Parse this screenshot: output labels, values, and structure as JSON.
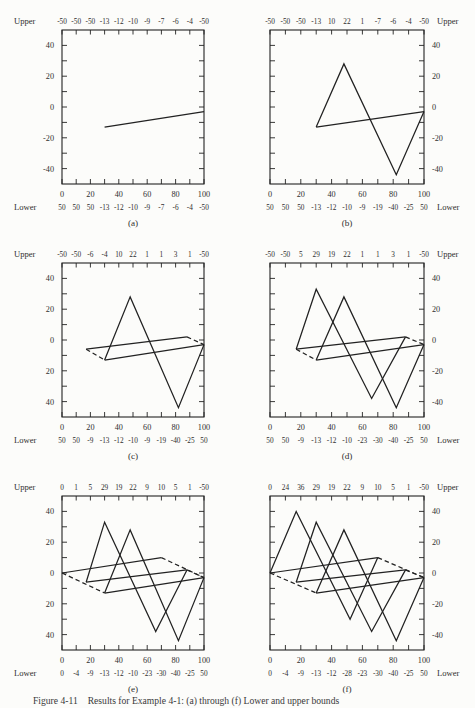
{
  "page": {
    "background": "#fcfcfa",
    "ink": "#2e2e2e",
    "line_color": "#222222"
  },
  "caption": {
    "number": "Figure 4-11",
    "text": "Results for Example 4-1: (a) through (f) Lower and upper bounds"
  },
  "chart_data": [
    {
      "type": "line",
      "label": "(a)",
      "label_side": "left",
      "upper_word": "Upper",
      "lower_word": "Lower",
      "upper_row": [
        "-50",
        "-50",
        "-50",
        "-13",
        "-12",
        "-10",
        "-9",
        "-7",
        "-6",
        "-4",
        "-50"
      ],
      "lower_row": [
        "50",
        "50",
        "50",
        "-13",
        "-12",
        "-10",
        "-9",
        "-7",
        "-6",
        "-4",
        "-50"
      ],
      "x_tick_labels": [
        "0",
        "20",
        "40",
        "60",
        "80",
        "100"
      ],
      "y_tick_labels": [
        "40",
        "20",
        "0",
        "-20",
        "-40"
      ],
      "xlim": [
        0,
        100
      ],
      "ylim": [
        -50,
        50
      ],
      "series": [
        {
          "name": "segment-1",
          "style": "solid",
          "points": [
            [
              30,
              -13
            ],
            [
              100,
              -3
            ]
          ]
        }
      ]
    },
    {
      "type": "line",
      "label": "(b)",
      "label_side": "right",
      "upper_word": "Upper",
      "lower_word": "Lower",
      "upper_row": [
        "-50",
        "-50",
        "-50",
        "-13",
        "10",
        "22",
        "1",
        "-7",
        "-6",
        "-4",
        "-50"
      ],
      "lower_row": [
        "50",
        "50",
        "50",
        "-13",
        "-12",
        "-10",
        "-9",
        "-19",
        "-40",
        "-25",
        "50"
      ],
      "x_tick_labels": [
        "0",
        "20",
        "40",
        "60",
        "80",
        "100"
      ],
      "y_tick_labels": [
        "40",
        "20",
        "0",
        "-20",
        "-40"
      ],
      "xlim": [
        0,
        100
      ],
      "ylim": [
        -50,
        50
      ],
      "series": [
        {
          "name": "segment-1",
          "style": "solid",
          "points": [
            [
              30,
              -13
            ],
            [
              100,
              -3
            ]
          ]
        },
        {
          "name": "zigzag-1",
          "style": "solid",
          "points": [
            [
              30,
              -13
            ],
            [
              48,
              28
            ],
            [
              82,
              -44
            ],
            [
              100,
              -3
            ]
          ]
        }
      ]
    },
    {
      "type": "line",
      "label": "(c)",
      "label_side": "left",
      "upper_word": "Upper",
      "lower_word": "Lower",
      "upper_row": [
        "-50",
        "-50",
        "-6",
        "-4",
        "10",
        "22",
        "1",
        "1",
        "3",
        "1",
        "-50"
      ],
      "lower_row": [
        "50",
        "50",
        "-9",
        "-13",
        "-12",
        "-10",
        "-9",
        "-19",
        "-40",
        "-25",
        "50"
      ],
      "x_tick_labels": [
        "0",
        "20",
        "40",
        "60",
        "80",
        "100"
      ],
      "y_tick_labels": [
        "40",
        "20",
        "0",
        "20",
        "40"
      ],
      "xlim": [
        0,
        100
      ],
      "ylim": [
        -50,
        50
      ],
      "series": [
        {
          "name": "segment-1",
          "style": "solid",
          "points": [
            [
              30,
              -13
            ],
            [
              100,
              -3
            ]
          ]
        },
        {
          "name": "zigzag-1",
          "style": "solid",
          "points": [
            [
              30,
              -13
            ],
            [
              48,
              28
            ],
            [
              82,
              -44
            ],
            [
              100,
              -3
            ]
          ]
        },
        {
          "name": "upper-bound-2",
          "style": "solid",
          "points": [
            [
              17,
              -6
            ],
            [
              88,
              2
            ]
          ]
        },
        {
          "name": "upper-bound-2-dash-left",
          "style": "dashed",
          "points": [
            [
              17,
              -6
            ],
            [
              30,
              -13
            ]
          ]
        },
        {
          "name": "upper-bound-2-dash-right",
          "style": "dashed",
          "points": [
            [
              88,
              2
            ],
            [
              100,
              -3
            ]
          ]
        }
      ]
    },
    {
      "type": "line",
      "label": "(d)",
      "label_side": "right",
      "upper_word": "Upper",
      "lower_word": "Lower",
      "upper_row": [
        "-50",
        "-50",
        "5",
        "29",
        "19",
        "22",
        "1",
        "1",
        "3",
        "1",
        "-50"
      ],
      "lower_row": [
        "50",
        "50",
        "-9",
        "-13",
        "-12",
        "-10",
        "-23",
        "-30",
        "-40",
        "-25",
        "50"
      ],
      "x_tick_labels": [
        "0",
        "20",
        "40",
        "60",
        "80",
        "100"
      ],
      "y_tick_labels": [
        "40",
        "20",
        "0",
        "-20",
        "-40"
      ],
      "xlim": [
        0,
        100
      ],
      "ylim": [
        -50,
        50
      ],
      "series": [
        {
          "name": "segment-1",
          "style": "solid",
          "points": [
            [
              30,
              -13
            ],
            [
              100,
              -3
            ]
          ]
        },
        {
          "name": "zigzag-1",
          "style": "solid",
          "points": [
            [
              30,
              -13
            ],
            [
              48,
              28
            ],
            [
              82,
              -44
            ],
            [
              100,
              -3
            ]
          ]
        },
        {
          "name": "zigzag-2",
          "style": "solid",
          "points": [
            [
              17,
              -6
            ],
            [
              30,
              33
            ],
            [
              66,
              -38
            ],
            [
              88,
              2
            ]
          ]
        },
        {
          "name": "upper-bound-2",
          "style": "solid",
          "points": [
            [
              17,
              -6
            ],
            [
              88,
              2
            ]
          ]
        },
        {
          "name": "upper-bound-2-dash-left",
          "style": "dashed",
          "points": [
            [
              17,
              -6
            ],
            [
              30,
              -13
            ]
          ]
        },
        {
          "name": "upper-bound-2-dash-right",
          "style": "dashed",
          "points": [
            [
              88,
              2
            ],
            [
              100,
              -3
            ]
          ]
        }
      ]
    },
    {
      "type": "line",
      "label": "(e)",
      "label_side": "left",
      "upper_word": "Upper",
      "lower_word": "Lower",
      "upper_row": [
        "0",
        "1",
        "5",
        "29",
        "19",
        "22",
        "9",
        "10",
        "5",
        "1",
        "-50"
      ],
      "lower_row": [
        "0",
        "-4",
        "-9",
        "-13",
        "-12",
        "-10",
        "-23",
        "-30",
        "-40",
        "-25",
        "50"
      ],
      "x_tick_labels": [
        "0",
        "20",
        "40",
        "60",
        "80",
        "100"
      ],
      "y_tick_labels": [
        "40",
        "20",
        "0",
        "20",
        "40"
      ],
      "xlim": [
        0,
        100
      ],
      "ylim": [
        -50,
        50
      ],
      "series": [
        {
          "name": "segment-1",
          "style": "solid",
          "points": [
            [
              30,
              -13
            ],
            [
              100,
              -3
            ]
          ]
        },
        {
          "name": "zigzag-1",
          "style": "solid",
          "points": [
            [
              30,
              -13
            ],
            [
              48,
              28
            ],
            [
              82,
              -44
            ],
            [
              100,
              -3
            ]
          ]
        },
        {
          "name": "zigzag-2",
          "style": "solid",
          "points": [
            [
              17,
              -6
            ],
            [
              30,
              33
            ],
            [
              66,
              -38
            ],
            [
              88,
              2
            ]
          ]
        },
        {
          "name": "upper-bound-2",
          "style": "solid",
          "points": [
            [
              17,
              -6
            ],
            [
              88,
              2
            ]
          ]
        },
        {
          "name": "upper-bound-3",
          "style": "solid",
          "points": [
            [
              0,
              0
            ],
            [
              70,
              10
            ]
          ]
        },
        {
          "name": "lower-bound-dash-left",
          "style": "dashed",
          "points": [
            [
              0,
              0
            ],
            [
              30,
              -13
            ]
          ]
        },
        {
          "name": "upper-bound-2-dash-right",
          "style": "dashed",
          "points": [
            [
              88,
              2
            ],
            [
              100,
              -3
            ]
          ]
        },
        {
          "name": "upper-bound-3-dash-right",
          "style": "dashed",
          "points": [
            [
              70,
              10
            ],
            [
              100,
              -3
            ]
          ]
        }
      ]
    },
    {
      "type": "line",
      "label": "(f)",
      "label_side": "right",
      "upper_word": "Upper",
      "lower_word": "Lower",
      "upper_row": [
        "0",
        "24",
        "36",
        "29",
        "19",
        "22",
        "9",
        "10",
        "5",
        "1",
        "-50"
      ],
      "lower_row": [
        "0",
        "-4",
        "-9",
        "-13",
        "-12",
        "-28",
        "-23",
        "-30",
        "-40",
        "-25",
        "50"
      ],
      "x_tick_labels": [
        "0",
        "20",
        "40",
        "60",
        "80",
        "100"
      ],
      "y_tick_labels": [
        "40",
        "20",
        "0",
        "-20",
        "-40"
      ],
      "xlim": [
        0,
        100
      ],
      "ylim": [
        -50,
        50
      ],
      "series": [
        {
          "name": "segment-1",
          "style": "solid",
          "points": [
            [
              30,
              -13
            ],
            [
              100,
              -3
            ]
          ]
        },
        {
          "name": "zigzag-1",
          "style": "solid",
          "points": [
            [
              30,
              -13
            ],
            [
              48,
              28
            ],
            [
              82,
              -44
            ],
            [
              100,
              -3
            ]
          ]
        },
        {
          "name": "zigzag-2",
          "style": "solid",
          "points": [
            [
              17,
              -6
            ],
            [
              30,
              33
            ],
            [
              66,
              -38
            ],
            [
              88,
              2
            ]
          ]
        },
        {
          "name": "zigzag-3",
          "style": "solid",
          "points": [
            [
              0,
              0
            ],
            [
              17,
              40
            ],
            [
              52,
              -30
            ],
            [
              70,
              10
            ]
          ]
        },
        {
          "name": "upper-bound-2",
          "style": "solid",
          "points": [
            [
              17,
              -6
            ],
            [
              88,
              2
            ]
          ]
        },
        {
          "name": "upper-bound-3",
          "style": "solid",
          "points": [
            [
              0,
              0
            ],
            [
              70,
              10
            ]
          ]
        },
        {
          "name": "lower-bound-dash-left",
          "style": "dashed",
          "points": [
            [
              0,
              0
            ],
            [
              30,
              -13
            ]
          ]
        },
        {
          "name": "upper-bound-2-dash-right",
          "style": "dashed",
          "points": [
            [
              88,
              2
            ],
            [
              100,
              -3
            ]
          ]
        },
        {
          "name": "upper-bound-3-dash-right",
          "style": "dashed",
          "points": [
            [
              70,
              10
            ],
            [
              100,
              -3
            ]
          ]
        }
      ]
    }
  ]
}
